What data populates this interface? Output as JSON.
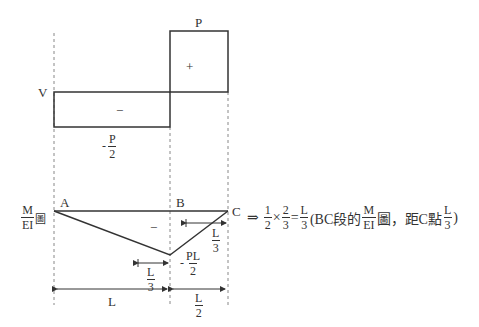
{
  "shear_diagram": {
    "axis_label": "V",
    "positive_value": "P",
    "positive_sign": "+",
    "negative_sign": "−",
    "negative_value": {
      "sign": "-",
      "num": "P",
      "den": "2"
    }
  },
  "moment_diagram": {
    "axis_label": {
      "num": "M",
      "den": "EI",
      "suffix": "圖"
    },
    "points": {
      "a": "A",
      "b": "B",
      "c": "C"
    },
    "sign": "−",
    "min_value": {
      "sign": "-",
      "num": "PL",
      "den": "2"
    },
    "centroid_left": {
      "num": "L",
      "den": "3"
    },
    "centroid_right": {
      "num": "L",
      "den": "3"
    },
    "span_ab": "L",
    "span_bc": {
      "num": "L",
      "den": "2"
    }
  },
  "expression": {
    "arrow": "⇒",
    "f1": {
      "num": "1",
      "den": "2"
    },
    "times": "×",
    "f2": {
      "num": "2",
      "den": "3"
    },
    "equals": "=",
    "f3": {
      "num": "L",
      "den": "3"
    },
    "open": "(BC段的",
    "f4": {
      "num": "M",
      "den": "EI"
    },
    "mid": "圖，距C點",
    "f5": {
      "num": "L",
      "den": "3"
    },
    "close": ")"
  },
  "colors": {
    "line": "#333333",
    "dash": "#888888"
  }
}
